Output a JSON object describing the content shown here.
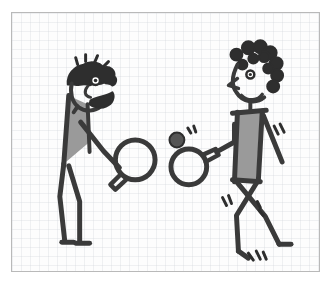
{
  "scene": {
    "title": "Two stick figures playing table tennis",
    "style": "hand-drawn marker sketch on graph paper",
    "caption": "",
    "frame": {
      "border_color": "#b9b9b9",
      "background_color": "#fdfdfd",
      "grid_color": "#ced2d8",
      "x": 11,
      "y": 12,
      "width": 309,
      "height": 260
    },
    "palette": {
      "ink": "#3a3a3a",
      "ink_dark": "#2e2e2e",
      "fill_gray": "#9a9a9a",
      "paper": "#fdfdfd",
      "page": "#ffffff"
    }
  },
  "figures": [
    {
      "id": "left-player",
      "label": "Left player leaning forward",
      "pose": "bent over, crouched, leaning to the right",
      "hair": "short spiky curly hair",
      "face": "eye, nose, beard and mustache",
      "torso_fill": "#9a9a9a",
      "holds": "paddle in right hand, low forehand position",
      "motion_marks": 0
    },
    {
      "id": "right-player",
      "label": "Right player standing, mid-stride",
      "pose": "upright, mid-step with legs apart",
      "hair": "curly looped hair",
      "face": "eye, pointed nose, smiling mouth",
      "torso_fill": "#9a9a9a",
      "holds": "paddle in left hand, arm extended forward",
      "motion_marks": 4
    }
  ],
  "objects": [
    {
      "id": "left-paddle",
      "label": "Left player's table tennis paddle",
      "shape": "circle with handle",
      "cx": 124,
      "cy": 148,
      "r": 20
    },
    {
      "id": "right-paddle",
      "label": "Right player's table tennis paddle",
      "shape": "circle with handle",
      "cx": 180,
      "cy": 152,
      "r": 18
    },
    {
      "id": "ball",
      "label": "Table tennis ball in flight",
      "shape": "filled circle with motion lines",
      "cx": 166,
      "cy": 128,
      "r": 7,
      "fill": "#555555"
    }
  ],
  "motion_lines": [
    {
      "id": "ball-swoosh",
      "near": "ball",
      "count": 2
    },
    {
      "id": "right-arm-swoosh",
      "near": "right-player-arm",
      "count": 2
    },
    {
      "id": "right-knee-swoosh",
      "near": "right-player-left-knee",
      "count": 2
    },
    {
      "id": "right-thigh-swoosh",
      "near": "right-player-right-thigh",
      "count": 2
    },
    {
      "id": "right-foot-swoosh",
      "near": "right-player-foot",
      "count": 3
    }
  ]
}
